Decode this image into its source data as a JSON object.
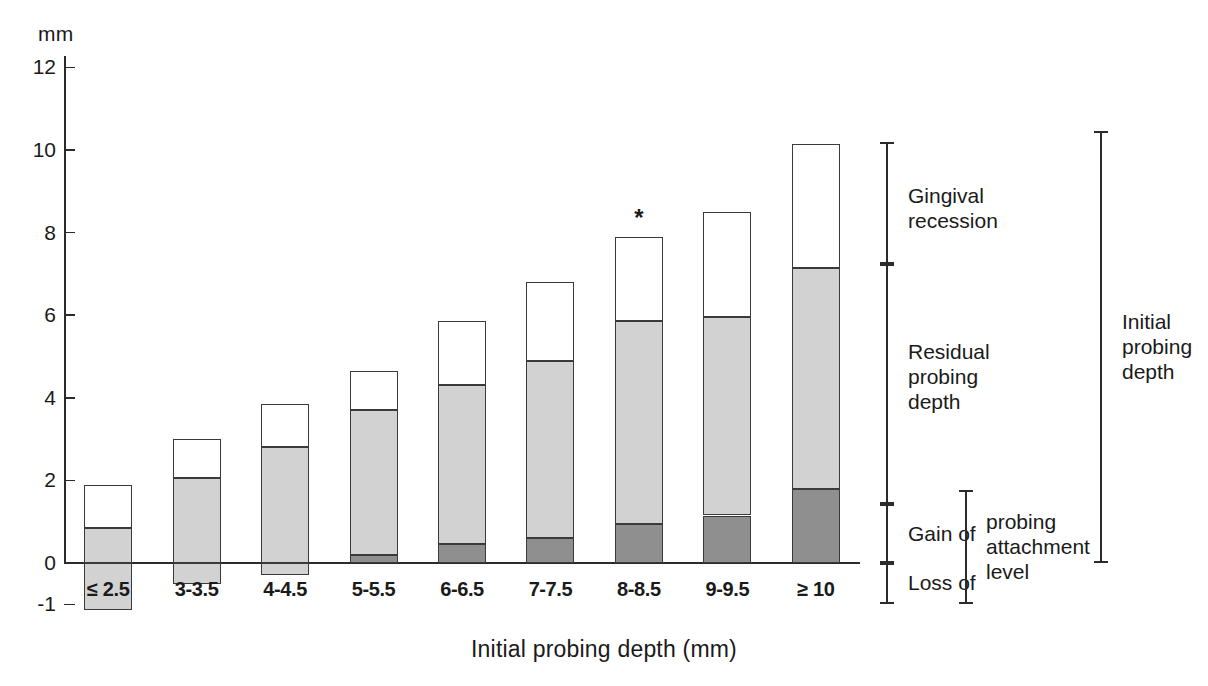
{
  "axis": {
    "unit_label": "mm",
    "x_title": "Initial probing depth (mm)",
    "y_ticks": [
      "12",
      "10",
      "8",
      "6",
      "4",
      "2",
      "0",
      "-1"
    ],
    "y_tick_values": [
      12,
      10,
      8,
      6,
      4,
      2,
      0,
      -1
    ],
    "ylim": [
      -1.3,
      12.6
    ]
  },
  "annotations": {
    "significance_marker": "*",
    "gingival_recession": "Gingival\nrecession",
    "gingival_recession_line1": "Gingival",
    "gingival_recession_line2": "recession",
    "residual_line1": "Residual",
    "residual_line2": "probing",
    "residual_line3": "depth",
    "gain_of": "Gain of",
    "loss_of": "Loss of",
    "pal_line1": "probing",
    "pal_line2": "attachment",
    "pal_line3": "level",
    "initial_line1": "Initial",
    "initial_line2": "probing",
    "initial_line3": "depth"
  },
  "colors": {
    "recession": "#ffffff",
    "residual": "#d2d2d2",
    "gain": "#8f8f8f",
    "loss": "#d2d2d2",
    "stroke": "#3a3a3a",
    "axis": "#2b2b2b"
  },
  "chart_data": {
    "type": "bar",
    "title": "",
    "subtitle": "",
    "xlabel": "Initial probing depth (mm)",
    "ylabel": "mm",
    "ylim": [
      -1.3,
      12.6
    ],
    "grid": false,
    "legend_position": "right",
    "stacked": true,
    "categories": [
      "≤ 2.5",
      "3-3.5",
      "4-4.5",
      "5-5.5",
      "6-6.5",
      "7-7.5",
      "8-8.5",
      "9-9.5",
      "≥ 10"
    ],
    "series": [
      {
        "name": "Initial probing depth (total bar top)",
        "values": [
          1.9,
          3.0,
          3.85,
          4.65,
          5.85,
          6.8,
          7.9,
          8.5,
          10.15
        ]
      },
      {
        "name": "Residual probing depth (upper boundary of grey)",
        "values": [
          0.85,
          2.05,
          2.8,
          3.7,
          4.3,
          4.9,
          5.85,
          5.95,
          7.15
        ]
      },
      {
        "name": "Gain of probing attachment level (dark grey top)",
        "values": [
          0.0,
          0.0,
          0.0,
          0.2,
          0.45,
          0.6,
          0.95,
          1.15,
          1.8
        ]
      },
      {
        "name": "Loss of probing attachment level (bar bottom, negative)",
        "values": [
          -1.15,
          -0.5,
          -0.3,
          0.0,
          0.0,
          0.0,
          0.0,
          0.0,
          0.0
        ]
      }
    ],
    "segments": [
      {
        "name": "Gingival recession",
        "color": "#ffffff"
      },
      {
        "name": "Residual probing depth",
        "color": "#d2d2d2"
      },
      {
        "name": "Gain of probing attachment level",
        "color": "#8f8f8f"
      },
      {
        "name": "Loss of probing attachment level",
        "color": "#d2d2d2"
      }
    ],
    "markers": [
      {
        "category": "8-8.5",
        "symbol": "*"
      }
    ],
    "brackets": [
      {
        "label": "Gingival recession",
        "from": 5.85,
        "to": 10.15
      },
      {
        "label": "Residual probing depth",
        "from": 0.0,
        "to": 5.85
      },
      {
        "label": "Gain of",
        "from": -1.0,
        "to": 0.0
      },
      {
        "label": "Loss of",
        "from": -1.3,
        "to": -1.0
      },
      {
        "label": "probing attachment level",
        "from": -1.3,
        "to": 0.0
      },
      {
        "label": "Initial probing depth",
        "from": 0.0,
        "to": 10.9
      }
    ]
  }
}
